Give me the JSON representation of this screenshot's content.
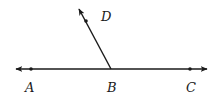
{
  "diagram": {
    "type": "geometry-angle",
    "stroke_color": "#1a1a1a",
    "background": "#ffffff",
    "line": {
      "name": "line-AC",
      "from": [
        14,
        69
      ],
      "to": [
        209,
        69
      ],
      "arrows": "both"
    },
    "ray": {
      "name": "ray-BD",
      "from": [
        111,
        69
      ],
      "to": [
        78,
        7
      ],
      "arrows": "end"
    },
    "points": [
      {
        "id": "A",
        "label": "A",
        "dot": [
          31,
          69
        ],
        "label_pos": [
          30,
          89
        ]
      },
      {
        "id": "B",
        "label": "B",
        "dot": [
          111,
          69
        ],
        "label_pos": [
          112,
          89
        ]
      },
      {
        "id": "C",
        "label": "C",
        "dot": [
          190,
          69
        ],
        "label_pos": [
          191,
          89
        ]
      },
      {
        "id": "D",
        "label": "D",
        "dot": [
          86,
          21
        ],
        "label_pos": [
          106,
          19
        ]
      }
    ]
  }
}
